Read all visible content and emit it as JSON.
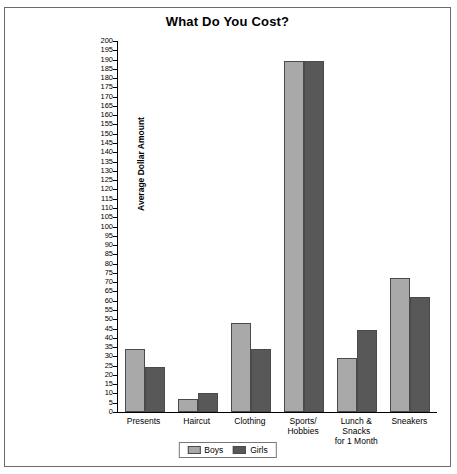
{
  "chart": {
    "title": "What Do You Cost?",
    "ylabel": "Average Dollar Amount"
  },
  "legend": {
    "boys_label": "Boys",
    "girls_label": "Girls",
    "boys_color": "#a9a9a9",
    "girls_color": "#585858"
  },
  "chart_data": {
    "type": "bar",
    "title": "What Do You Cost?",
    "xlabel": "",
    "ylabel": "Average Dollar Amount",
    "ylim": [
      0,
      200
    ],
    "ytick_step": 5,
    "grid": false,
    "legend_position": "bottom",
    "categories": [
      "Presents",
      "Haircut",
      "Clothing",
      "Sports/\nHobbies",
      "Lunch &\nSnacks\nfor 1 Month",
      "Sneakers"
    ],
    "yticks": [
      0,
      5,
      10,
      15,
      20,
      25,
      30,
      35,
      40,
      45,
      50,
      55,
      60,
      65,
      70,
      75,
      80,
      85,
      90,
      95,
      100,
      105,
      110,
      115,
      120,
      125,
      130,
      135,
      140,
      145,
      150,
      155,
      160,
      165,
      170,
      175,
      180,
      185,
      190,
      195,
      200
    ],
    "series": [
      {
        "name": "Boys",
        "color": "#a9a9a9",
        "values": [
          34,
          7,
          48,
          189,
          29,
          72
        ]
      },
      {
        "name": "Girls",
        "color": "#585858",
        "values": [
          24,
          10,
          34,
          189,
          44,
          62
        ]
      }
    ]
  }
}
